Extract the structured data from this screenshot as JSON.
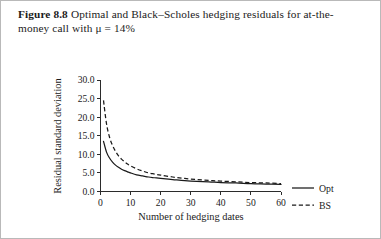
{
  "figure": {
    "number_label": "Figure 8.8",
    "caption_text": "Optimal and Black–Scholes hedging residuals for at-the-money call with μ = 14%"
  },
  "chart_data": {
    "type": "line",
    "title": "",
    "xlabel": "Number of hedging dates",
    "ylabel": "Residual standard deviation",
    "xlim": [
      0,
      60
    ],
    "ylim": [
      0,
      30
    ],
    "xticks": [
      0,
      10,
      20,
      30,
      40,
      50,
      60
    ],
    "xtick_labels": [
      "0",
      "10",
      "20",
      "30",
      "40",
      "50",
      "60"
    ],
    "yticks": [
      0.0,
      5.0,
      10.0,
      15.0,
      20.0,
      25.0,
      30.0
    ],
    "ytick_labels": [
      "0.0",
      "5.0",
      "10.0",
      "15.0",
      "20.0",
      "25.0",
      "30.0"
    ],
    "grid": false,
    "legend_position": "right",
    "x": [
      1,
      2,
      3,
      4,
      5,
      6,
      7,
      8,
      9,
      10,
      12,
      14,
      16,
      18,
      20,
      24,
      28,
      32,
      36,
      40,
      45,
      50,
      55,
      60
    ],
    "series": [
      {
        "name": "Opt",
        "style": "solid",
        "color": "#1a1a1a",
        "values": [
          13.5,
          10.6,
          9.0,
          7.9,
          7.1,
          6.5,
          6.0,
          5.6,
          5.3,
          5.0,
          4.5,
          4.2,
          3.9,
          3.7,
          3.5,
          3.2,
          2.9,
          2.7,
          2.6,
          2.4,
          2.3,
          2.1,
          2.0,
          1.9
        ]
      },
      {
        "name": "BS",
        "style": "dashed",
        "color": "#1a1a1a",
        "values": [
          24.5,
          18.2,
          14.6,
          12.4,
          10.8,
          9.6,
          8.7,
          8.0,
          7.4,
          6.9,
          6.1,
          5.5,
          5.0,
          4.7,
          4.4,
          3.9,
          3.5,
          3.2,
          3.0,
          2.8,
          2.6,
          2.4,
          2.3,
          2.1
        ]
      }
    ],
    "legend": [
      {
        "label": "Opt",
        "style": "solid"
      },
      {
        "label": "BS",
        "style": "dashed"
      }
    ]
  }
}
